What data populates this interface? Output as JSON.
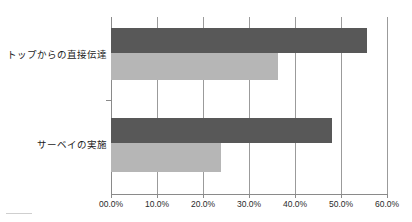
{
  "chart_data": {
    "type": "bar",
    "orientation": "horizontal",
    "title": "",
    "subtitle": "",
    "xlabel": "",
    "ylabel": "",
    "xlim": [
      0,
      60
    ],
    "grid": "vertical",
    "legend": "none",
    "categories": [
      "トップからの直接伝達",
      "サーベイの実施"
    ],
    "xticks": [
      0,
      10,
      20,
      30,
      40,
      50,
      60
    ],
    "xtick_labels": [
      "00.0%",
      "10.0%",
      "20.0%",
      "30.0%",
      "40.0%",
      "50.0%",
      "60.0%"
    ],
    "series": [
      {
        "name": "series-a",
        "color": "#585858",
        "values": [
          55.7,
          48.0
        ]
      },
      {
        "name": "series-b",
        "color": "#b6b6b6",
        "values": [
          36.3,
          23.9
        ]
      }
    ]
  },
  "colors": {
    "series_a": "#585858",
    "series_b": "#b6b6b6",
    "grid": "#9b9b9b",
    "axis": "#8a8a8a",
    "text": "#1b1b1b",
    "background": "#ffffff"
  }
}
